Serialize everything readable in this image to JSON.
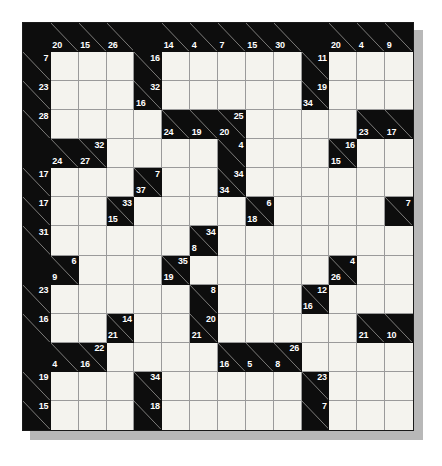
{
  "puzzle": {
    "name": "Kakuro Puzzle Grid",
    "type": "kakuro",
    "rows": 14,
    "cols": 14,
    "colors": {
      "block": "#0d0d0d",
      "open": "#f4f3ee",
      "clue_text": "#ffffff",
      "grid_line": "#9a9a9a",
      "border": "#1a1a1a",
      "shadow": "#b8b8b8",
      "page": "#ffffff"
    },
    "grid": [
      [
        {
          "t": "b"
        },
        {
          "t": "c",
          "down": "20"
        },
        {
          "t": "c",
          "down": "15"
        },
        {
          "t": "c",
          "down": "26"
        },
        {
          "t": "b"
        },
        {
          "t": "c",
          "down": "14"
        },
        {
          "t": "c",
          "down": "4"
        },
        {
          "t": "c",
          "down": "7"
        },
        {
          "t": "c",
          "down": "15"
        },
        {
          "t": "c",
          "down": "30"
        },
        {
          "t": "b"
        },
        {
          "t": "c",
          "down": "20"
        },
        {
          "t": "c",
          "down": "4"
        },
        {
          "t": "c",
          "down": "9"
        }
      ],
      [
        {
          "t": "c",
          "across": "7"
        },
        {
          "t": "o"
        },
        {
          "t": "o"
        },
        {
          "t": "o"
        },
        {
          "t": "c",
          "across": "16"
        },
        {
          "t": "o"
        },
        {
          "t": "o"
        },
        {
          "t": "o"
        },
        {
          "t": "o"
        },
        {
          "t": "o"
        },
        {
          "t": "c",
          "across": "11"
        },
        {
          "t": "o"
        },
        {
          "t": "o"
        },
        {
          "t": "o"
        }
      ],
      [
        {
          "t": "c",
          "across": "23"
        },
        {
          "t": "o"
        },
        {
          "t": "o"
        },
        {
          "t": "o"
        },
        {
          "t": "c",
          "across": "32",
          "down": "16"
        },
        {
          "t": "o"
        },
        {
          "t": "o"
        },
        {
          "t": "o"
        },
        {
          "t": "o"
        },
        {
          "t": "o"
        },
        {
          "t": "c",
          "across": "19",
          "down": "34"
        },
        {
          "t": "o"
        },
        {
          "t": "o"
        },
        {
          "t": "o"
        }
      ],
      [
        {
          "t": "c",
          "across": "28"
        },
        {
          "t": "o"
        },
        {
          "t": "o"
        },
        {
          "t": "o"
        },
        {
          "t": "o"
        },
        {
          "t": "c",
          "down": "24"
        },
        {
          "t": "c",
          "down": "19"
        },
        {
          "t": "c",
          "across": "25",
          "down": "20"
        },
        {
          "t": "o"
        },
        {
          "t": "o"
        },
        {
          "t": "o"
        },
        {
          "t": "o"
        },
        {
          "t": "c",
          "down": "23"
        },
        {
          "t": "c",
          "down": "17"
        }
      ],
      [
        {
          "t": "b"
        },
        {
          "t": "c",
          "down": "24"
        },
        {
          "t": "c",
          "across": "32",
          "down": "27"
        },
        {
          "t": "o"
        },
        {
          "t": "o"
        },
        {
          "t": "o"
        },
        {
          "t": "o"
        },
        {
          "t": "c",
          "across": "4"
        },
        {
          "t": "o"
        },
        {
          "t": "o"
        },
        {
          "t": "o"
        },
        {
          "t": "c",
          "across": "16",
          "down": "15"
        },
        {
          "t": "o"
        },
        {
          "t": "o"
        }
      ],
      [
        {
          "t": "c",
          "across": "17"
        },
        {
          "t": "o"
        },
        {
          "t": "o"
        },
        {
          "t": "o"
        },
        {
          "t": "c",
          "across": "7",
          "down": "37"
        },
        {
          "t": "o"
        },
        {
          "t": "o"
        },
        {
          "t": "c",
          "across": "34",
          "down": "34"
        },
        {
          "t": "o"
        },
        {
          "t": "o"
        },
        {
          "t": "o"
        },
        {
          "t": "o"
        },
        {
          "t": "o"
        },
        {
          "t": "o"
        }
      ],
      [
        {
          "t": "c",
          "across": "17"
        },
        {
          "t": "o"
        },
        {
          "t": "o"
        },
        {
          "t": "c",
          "across": "33",
          "down": "15"
        },
        {
          "t": "o"
        },
        {
          "t": "o"
        },
        {
          "t": "o"
        },
        {
          "t": "o"
        },
        {
          "t": "c",
          "across": "6",
          "down": "18"
        },
        {
          "t": "o"
        },
        {
          "t": "o"
        },
        {
          "t": "o"
        },
        {
          "t": "o"
        },
        {
          "t": "c",
          "across": "7"
        }
      ],
      [
        {
          "t": "c",
          "across": "31"
        },
        {
          "t": "o"
        },
        {
          "t": "o"
        },
        {
          "t": "o"
        },
        {
          "t": "o"
        },
        {
          "t": "o"
        },
        {
          "t": "c",
          "across": "34",
          "down": "8"
        },
        {
          "t": "o"
        },
        {
          "t": "o"
        },
        {
          "t": "o"
        },
        {
          "t": "o"
        },
        {
          "t": "o"
        },
        {
          "t": "o"
        },
        {
          "t": "o"
        }
      ],
      [
        {
          "t": "b"
        },
        {
          "t": "c",
          "across": "6",
          "down": "9"
        },
        {
          "t": "o"
        },
        {
          "t": "o"
        },
        {
          "t": "o"
        },
        {
          "t": "c",
          "across": "35",
          "down": "19"
        },
        {
          "t": "o"
        },
        {
          "t": "o"
        },
        {
          "t": "o"
        },
        {
          "t": "o"
        },
        {
          "t": "o"
        },
        {
          "t": "c",
          "across": "4",
          "down": "26"
        },
        {
          "t": "o"
        },
        {
          "t": "o"
        }
      ],
      [
        {
          "t": "c",
          "across": "23"
        },
        {
          "t": "o"
        },
        {
          "t": "o"
        },
        {
          "t": "o"
        },
        {
          "t": "o"
        },
        {
          "t": "o"
        },
        {
          "t": "c",
          "across": "8"
        },
        {
          "t": "o"
        },
        {
          "t": "o"
        },
        {
          "t": "o"
        },
        {
          "t": "c",
          "across": "12",
          "down": "16"
        },
        {
          "t": "o"
        },
        {
          "t": "o"
        },
        {
          "t": "o"
        }
      ],
      [
        {
          "t": "c",
          "across": "16"
        },
        {
          "t": "o"
        },
        {
          "t": "o"
        },
        {
          "t": "c",
          "across": "14",
          "down": "21"
        },
        {
          "t": "o"
        },
        {
          "t": "o"
        },
        {
          "t": "c",
          "across": "20",
          "down": "21"
        },
        {
          "t": "o"
        },
        {
          "t": "o"
        },
        {
          "t": "o"
        },
        {
          "t": "o"
        },
        {
          "t": "o"
        },
        {
          "t": "c",
          "down": "21"
        },
        {
          "t": "c",
          "down": "10"
        }
      ],
      [
        {
          "t": "b"
        },
        {
          "t": "c",
          "down": "4"
        },
        {
          "t": "c",
          "across": "22",
          "down": "16"
        },
        {
          "t": "o"
        },
        {
          "t": "o"
        },
        {
          "t": "o"
        },
        {
          "t": "o"
        },
        {
          "t": "c",
          "down": "16"
        },
        {
          "t": "c",
          "down": "5"
        },
        {
          "t": "c",
          "across": "26",
          "down": "8"
        },
        {
          "t": "o"
        },
        {
          "t": "o"
        },
        {
          "t": "o"
        },
        {
          "t": "o"
        }
      ],
      [
        {
          "t": "c",
          "across": "19"
        },
        {
          "t": "o"
        },
        {
          "t": "o"
        },
        {
          "t": "o"
        },
        {
          "t": "c",
          "across": "34"
        },
        {
          "t": "o"
        },
        {
          "t": "o"
        },
        {
          "t": "o"
        },
        {
          "t": "o"
        },
        {
          "t": "o"
        },
        {
          "t": "c",
          "across": "23"
        },
        {
          "t": "o"
        },
        {
          "t": "o"
        },
        {
          "t": "o"
        }
      ],
      [
        {
          "t": "c",
          "across": "15"
        },
        {
          "t": "o"
        },
        {
          "t": "o"
        },
        {
          "t": "o"
        },
        {
          "t": "c",
          "across": "18"
        },
        {
          "t": "o"
        },
        {
          "t": "o"
        },
        {
          "t": "o"
        },
        {
          "t": "o"
        },
        {
          "t": "o"
        },
        {
          "t": "c",
          "across": "7"
        },
        {
          "t": "o"
        },
        {
          "t": "o"
        },
        {
          "t": "o"
        }
      ]
    ]
  }
}
